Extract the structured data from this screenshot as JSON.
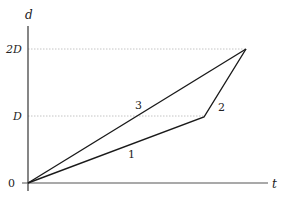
{
  "diagram": {
    "axes": {
      "y_label": "d",
      "x_label": "t",
      "origin_label": "0",
      "y_ticks": [
        {
          "label": "D",
          "value": 1
        },
        {
          "label": "2D",
          "value": 2
        }
      ]
    },
    "paths": [
      {
        "label": "1",
        "description": "segment from origin to kink at distance D (lower slope)"
      },
      {
        "label": "2",
        "description": "segment from kink at D up to 2D (steep slope)"
      },
      {
        "label": "3",
        "description": "straight line from origin to 2D"
      }
    ],
    "colors": {
      "line": "#1a1a1a",
      "axis": "#333333",
      "guide": "#aaaaaa",
      "text": "#222222"
    }
  }
}
